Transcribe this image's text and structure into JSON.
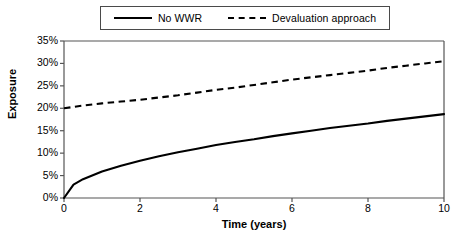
{
  "chart_data": {
    "type": "line",
    "title": "",
    "xlabel": "Time (years)",
    "ylabel": "Exposure",
    "xlim": [
      0,
      10
    ],
    "ylim": [
      0,
      35
    ],
    "grid": false,
    "legend_position": "top-center",
    "xticks": [
      "0",
      "2",
      "4",
      "6",
      "8",
      "10"
    ],
    "xtick_values": [
      0,
      2,
      4,
      6,
      8,
      10
    ],
    "yticks": [
      "0%",
      "5%",
      "10%",
      "15%",
      "20%",
      "25%",
      "30%",
      "35%"
    ],
    "ytick_values": [
      0,
      5,
      10,
      15,
      20,
      25,
      30,
      35
    ],
    "x": [
      0,
      0.25,
      0.5,
      1,
      1.5,
      2,
      2.5,
      3,
      3.5,
      4,
      4.5,
      5,
      5.5,
      6,
      6.5,
      7,
      7.5,
      8,
      8.5,
      9,
      9.5,
      10
    ],
    "series": [
      {
        "name": "No WWR",
        "style": "solid",
        "color": "#000000",
        "values": [
          0.0,
          3.0,
          4.2,
          5.9,
          7.2,
          8.3,
          9.3,
          10.2,
          11.0,
          11.8,
          12.5,
          13.1,
          13.8,
          14.4,
          15.0,
          15.6,
          16.1,
          16.6,
          17.2,
          17.7,
          18.2,
          18.7
        ]
      },
      {
        "name": "Devaluation approach",
        "style": "dashed",
        "color": "#000000",
        "values": [
          20.0,
          20.3,
          20.6,
          21.1,
          21.5,
          21.9,
          22.4,
          22.9,
          23.5,
          24.1,
          24.6,
          25.2,
          25.8,
          26.4,
          26.9,
          27.4,
          27.9,
          28.4,
          29.0,
          29.5,
          30.0,
          30.5
        ]
      }
    ]
  },
  "legend": {
    "entries": [
      {
        "label": "No WWR",
        "style": "solid"
      },
      {
        "label": "Devaluation approach",
        "style": "dashed"
      }
    ]
  }
}
